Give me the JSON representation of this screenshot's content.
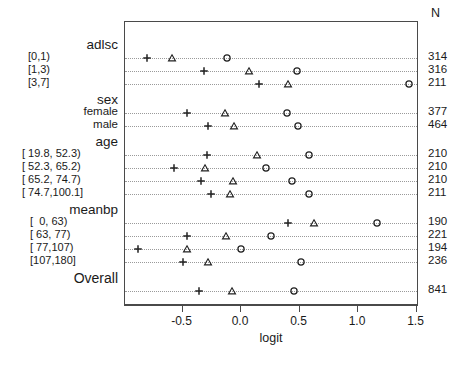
{
  "chart_data": {
    "type": "scatter",
    "title": "",
    "xlabel": "logit",
    "ylabel": "",
    "xlim": [
      -1.0,
      1.55
    ],
    "xticks": [
      -0.5,
      0.0,
      0.5,
      1.0,
      1.5
    ],
    "xticklabels": [
      "-0.5",
      "0.0",
      "0.5",
      "1.0",
      "1.5"
    ],
    "grid": "dotted-horizontal-leaders",
    "legend_position": "none",
    "n_column_header": "N",
    "markers": [
      "plus",
      "triangle",
      "circle"
    ],
    "groups": [
      {
        "name": "adlsc",
        "rows": [
          {
            "label": "[0,1)",
            "n": "314",
            "plus": -0.8,
            "triangle": -0.59,
            "circle": -0.12
          },
          {
            "label": "[1,3)",
            "n": "316",
            "plus": -0.32,
            "triangle": 0.07,
            "circle": 0.48
          },
          {
            "label": "[3,7]",
            "n": "211",
            "plus": 0.15,
            "triangle": 0.4,
            "circle": 1.44
          }
        ]
      },
      {
        "name": "sex",
        "rows": [
          {
            "label": "female",
            "n": "377",
            "plus": -0.46,
            "triangle": -0.14,
            "circle": 0.39
          },
          {
            "label": "male",
            "n": "464",
            "plus": -0.28,
            "triangle": -0.06,
            "circle": 0.49
          }
        ]
      },
      {
        "name": "age",
        "rows": [
          {
            "label": "[ 19.8, 52.3)",
            "n": "210",
            "plus": -0.29,
            "triangle": 0.14,
            "circle": 0.58
          },
          {
            "label": "[ 52.3, 65.2)",
            "n": "210",
            "plus": -0.57,
            "triangle": -0.31,
            "circle": 0.21
          },
          {
            "label": "[ 65.2, 74.7)",
            "n": "210",
            "plus": -0.34,
            "triangle": -0.07,
            "circle": 0.44
          },
          {
            "label": "[ 74.7,100.1]",
            "n": "211",
            "plus": -0.26,
            "triangle": -0.09,
            "circle": 0.58
          }
        ]
      },
      {
        "name": "meanbp",
        "rows": [
          {
            "label": "[  0, 63)",
            "n": "190",
            "plus": 0.4,
            "triangle": 0.62,
            "circle": 1.16
          },
          {
            "label": "[ 63, 77)",
            "n": "221",
            "plus": -0.46,
            "triangle": -0.13,
            "circle": 0.26
          },
          {
            "label": "[ 77,107)",
            "n": "194",
            "plus": -0.88,
            "triangle": -0.46,
            "circle": 0.0
          },
          {
            "label": "[107,180]",
            "n": "236",
            "plus": -0.5,
            "triangle": -0.28,
            "circle": 0.51
          }
        ]
      },
      {
        "name": "Overall",
        "rows": [
          {
            "label": "",
            "n": "841",
            "plus": -0.36,
            "triangle": -0.08,
            "circle": 0.45
          }
        ]
      }
    ]
  },
  "axis": {
    "x_title": "logit"
  },
  "colors": {
    "frame": "#4a4a4a",
    "leader": "#9a9a9a",
    "marker": "#222222",
    "text": "#1a1a1a"
  }
}
